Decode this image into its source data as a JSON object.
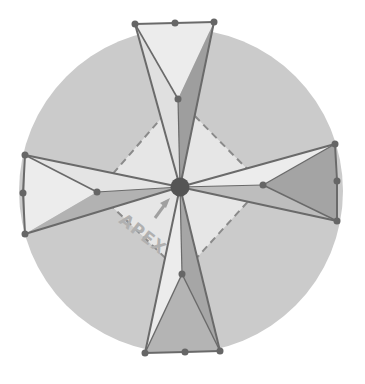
{
  "diagram": {
    "title": "",
    "annotation": {
      "label": "APEX",
      "arrow": "up-right arrow pointing to apex"
    },
    "colors": {
      "background": "#ffffff",
      "disc": "#cbcbcb",
      "light_facet": "#ececec",
      "medium_facet": "#bdbdbd",
      "dark_facet": "#9a9a9a",
      "edge": "#6a6a6a",
      "apex_dot": "#555555",
      "dashed_square": "#8a8a8a",
      "label": "#b0b0b0"
    },
    "disc": {
      "cx": 181,
      "cy": 191,
      "r": 162
    },
    "apex": {
      "x": 180,
      "y": 187,
      "r": 9
    },
    "dashed_square": [
      [
        178,
        99
      ],
      [
        263,
        185
      ],
      [
        182,
        274
      ],
      [
        97,
        192
      ]
    ],
    "arms": [
      {
        "name": "top",
        "outer": [
          [
            135,
            24
          ],
          [
            175,
            23
          ],
          [
            214,
            22
          ]
        ],
        "inner": [
          178,
          99
        ]
      },
      {
        "name": "left",
        "outer": [
          [
            25,
            155
          ],
          [
            23,
            193
          ],
          [
            25,
            234
          ]
        ],
        "inner": [
          97,
          192
        ]
      },
      {
        "name": "right",
        "outer": [
          [
            335,
            144
          ],
          [
            337,
            181
          ],
          [
            337,
            221
          ]
        ],
        "inner": [
          263,
          185
        ]
      },
      {
        "name": "bottom",
        "outer": [
          [
            145,
            353
          ],
          [
            185,
            352
          ],
          [
            220,
            351
          ]
        ],
        "inner": [
          182,
          274
        ]
      }
    ]
  }
}
